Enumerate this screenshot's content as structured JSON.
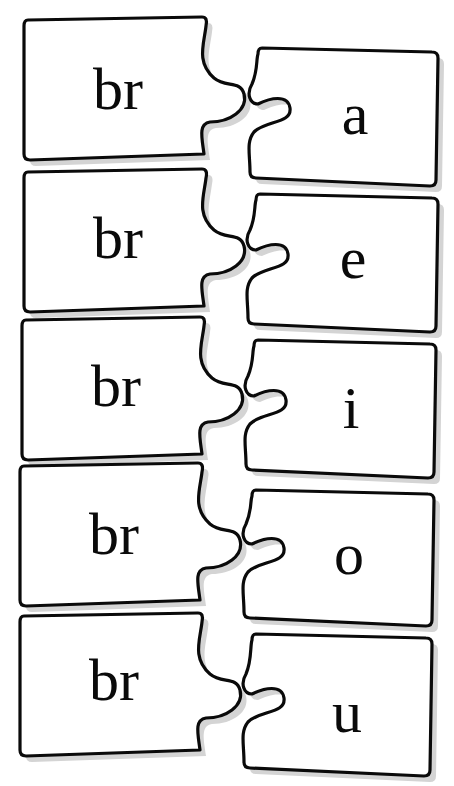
{
  "worksheet": {
    "title": "",
    "pairs": [
      {
        "left": "br",
        "right": "a"
      },
      {
        "left": "br",
        "right": "e"
      },
      {
        "left": "br",
        "right": "i"
      },
      {
        "left": "br",
        "right": "o"
      },
      {
        "left": "br",
        "right": "u"
      }
    ]
  },
  "colors": {
    "background": "#ffffff",
    "outline": "#0a0a0a",
    "shadow": "#d4d4d4",
    "text": "#0a0a0a"
  }
}
